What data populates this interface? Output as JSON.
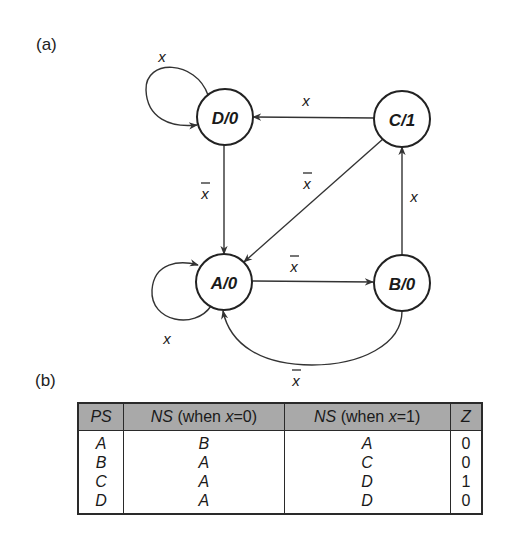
{
  "panels": {
    "a_label": "(a)",
    "b_label": "(b)"
  },
  "diagram": {
    "type": "state-diagram (Moore machine)",
    "nodes": [
      {
        "id": "D",
        "label": "D/0",
        "cx": 225,
        "cy": 117
      },
      {
        "id": "C",
        "label": "C/1",
        "cx": 402,
        "cy": 119
      },
      {
        "id": "A",
        "label": "A/0",
        "cx": 224,
        "cy": 282
      },
      {
        "id": "B",
        "label": "B/0",
        "cx": 402,
        "cy": 283
      }
    ],
    "edges": [
      {
        "from": "D",
        "to": "D",
        "label": "x",
        "complemented": false
      },
      {
        "from": "C",
        "to": "D",
        "label": "x",
        "complemented": false
      },
      {
        "from": "D",
        "to": "A",
        "label": "x",
        "complemented": true
      },
      {
        "from": "C",
        "to": "A",
        "label": "x",
        "complemented": true
      },
      {
        "from": "B",
        "to": "C",
        "label": "x",
        "complemented": false
      },
      {
        "from": "A",
        "to": "B",
        "label": "x",
        "complemented": true
      },
      {
        "from": "A",
        "to": "A",
        "label": "x",
        "complemented": false
      },
      {
        "from": "B",
        "to": "A",
        "label": "x",
        "complemented": true
      }
    ]
  },
  "table": {
    "headers": [
      {
        "italic": "PS",
        "rest": ""
      },
      {
        "italic": "NS",
        "rest": " (when ",
        "var": "x",
        "cond": "=0)"
      },
      {
        "italic": "NS",
        "rest": " (when ",
        "var": "x",
        "cond": "=1)"
      },
      {
        "italic": "Z",
        "rest": ""
      }
    ],
    "rows": [
      {
        "ps": "A",
        "ns0": "B",
        "ns1": "A",
        "z": "0"
      },
      {
        "ps": "B",
        "ns0": "A",
        "ns1": "C",
        "z": "0"
      },
      {
        "ps": "C",
        "ns0": "A",
        "ns1": "D",
        "z": "1"
      },
      {
        "ps": "D",
        "ns0": "A",
        "ns1": "D",
        "z": "0"
      }
    ]
  }
}
